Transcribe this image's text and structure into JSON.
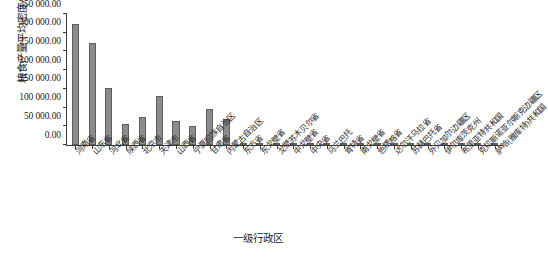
{
  "chart_data": {
    "type": "bar",
    "title": "",
    "xlabel": "一级行政区",
    "ylabel": "粮食产量平均密度/(kg/km²)",
    "ylim": [
      0,
      350000
    ],
    "ytick_values": [
      0,
      50000,
      100000,
      150000,
      200000,
      250000,
      300000,
      350000
    ],
    "ytick_labels": [
      "0.00",
      "50 000.00",
      "100 000.00",
      "150 000.00",
      "200 000.00",
      "250 000.00",
      "300 000.00",
      "350 000.00"
    ],
    "grid": false,
    "legend": "none",
    "bar_color": "#8c8c8c",
    "bar_edge_color": "#5e5e5e",
    "axis_color": "#3a3a3a",
    "categories": [
      "河南省",
      "山东省",
      "河北省",
      "陕西省",
      "北京市",
      "天津市",
      "山西省",
      "宁夏回族自治区",
      "甘肃省",
      "内蒙古自治区",
      "东方省",
      "东戈壁省",
      "戈壁苏木贝尔省",
      "中戈壁省",
      "中央省",
      "乌兰巴托",
      "肯特省",
      "南戈壁省",
      "色楞格省",
      "达尔汗乌拉省",
      "苏赫巴托省",
      "外贝加尔边疆区",
      "伊尔库茨克州",
      "布里亚特共和国",
      "克拉斯诺亚尔斯克边疆区",
      "萨哈(雅库特)共和国"
    ],
    "values": [
      322000,
      272000,
      152000,
      56000,
      74000,
      130000,
      65000,
      50000,
      97000,
      70000,
      1400,
      900,
      700,
      800,
      1100,
      600,
      900,
      4200,
      2600,
      900,
      700,
      500,
      900,
      700,
      400,
      200
    ]
  }
}
